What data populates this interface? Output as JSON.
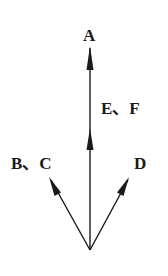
{
  "diagram": {
    "type": "vector-arrows",
    "labels": {
      "a": "A",
      "ef": "E、F",
      "bc": "B、C",
      "d": "D"
    },
    "colors": {
      "stroke": "#1a1a1a",
      "background": "#ffffff"
    },
    "origin": [
      90,
      250
    ],
    "arrows": [
      {
        "name": "A",
        "tip": [
          90,
          46
        ]
      },
      {
        "name": "E、F",
        "tip": [
          90,
          150
        ]
      },
      {
        "name": "B、C",
        "tip": [
          50,
          178
        ]
      },
      {
        "name": "D",
        "tip": [
          128,
          178
        ]
      }
    ]
  }
}
